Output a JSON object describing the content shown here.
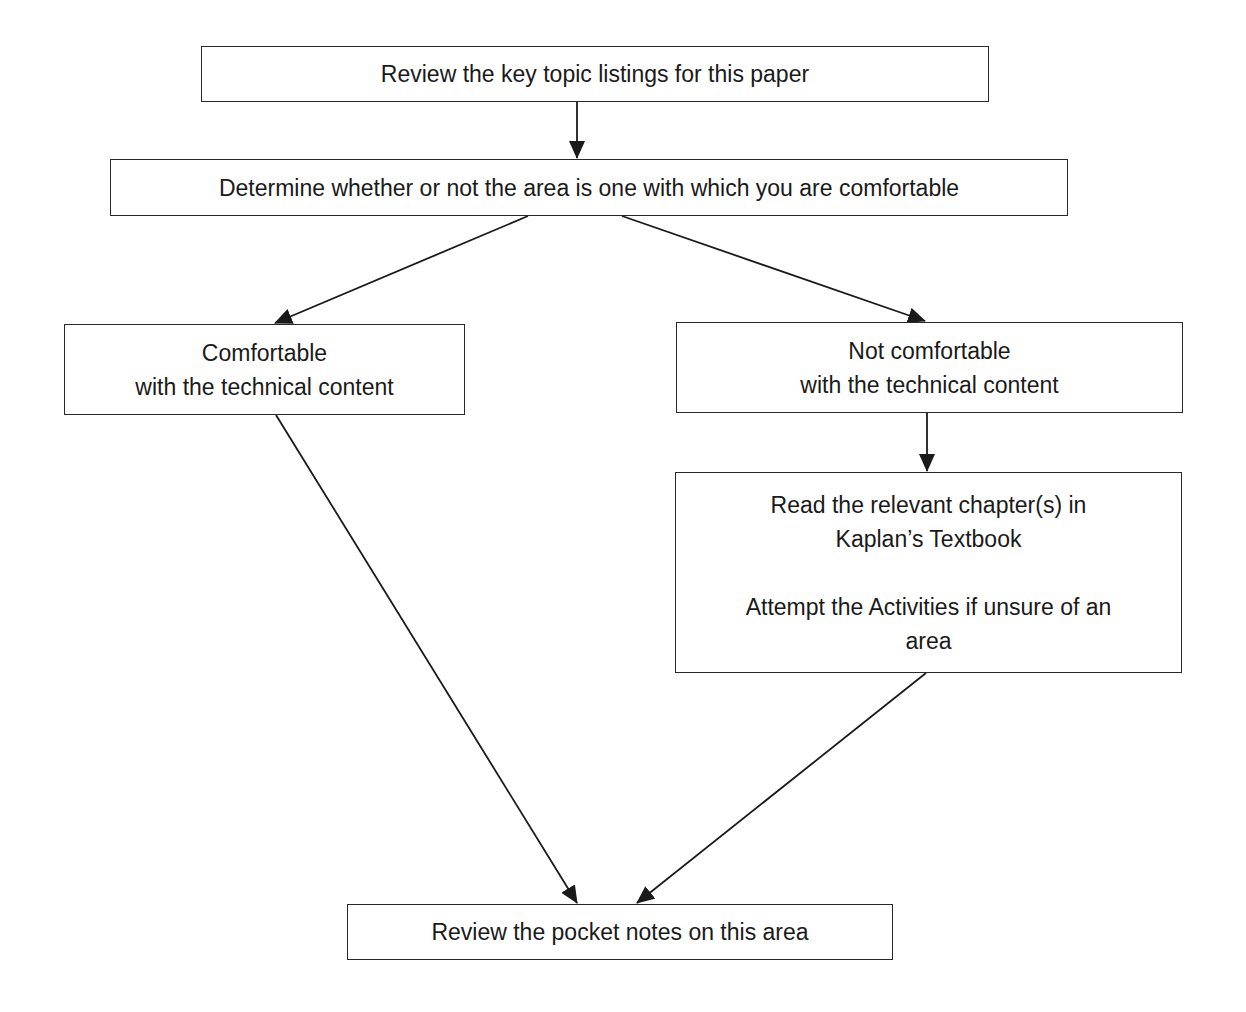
{
  "flowchart": {
    "nodes": {
      "review_topics": {
        "text": "Review the key  topic listings for this paper"
      },
      "determine": {
        "text": "Determine whether or not the area is one with which you are comfortable"
      },
      "comfortable": {
        "line1": "Comfortable",
        "line2": "with the technical content"
      },
      "not_comfortable": {
        "line1": "Not comfortable",
        "line2": "with the technical content"
      },
      "read_chapters": {
        "line1": "Read the relevant chapter(s) in",
        "line2": "Kaplan’s Textbook",
        "line3": "Attempt the Activities if unsure of an",
        "line4": "area"
      },
      "review_notes": {
        "text": "Review the pocket notes on this area"
      }
    },
    "edges": [
      {
        "from": "review_topics",
        "to": "determine"
      },
      {
        "from": "determine",
        "to": "comfortable"
      },
      {
        "from": "determine",
        "to": "not_comfortable"
      },
      {
        "from": "not_comfortable",
        "to": "read_chapters"
      },
      {
        "from": "comfortable",
        "to": "review_notes"
      },
      {
        "from": "read_chapters",
        "to": "review_notes"
      }
    ]
  }
}
